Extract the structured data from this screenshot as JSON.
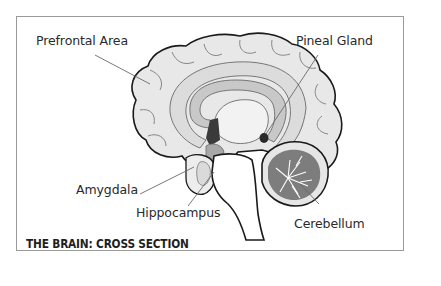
{
  "diagram": {
    "title": "THE BRAIN: CROSS SECTION",
    "labels": {
      "prefrontal": "Prefrontal Area",
      "pineal": "Pineal Gland",
      "amygdala": "Amygdala",
      "hippocampus": "Hippocampus",
      "cerebellum": "Cerebellum"
    },
    "colors": {
      "outline": "#1a1a1a",
      "cortex": "#e6e6e6",
      "corpus_callosum": "#d2d2d2",
      "ventricle": "#bdbdbd",
      "dark_structure": "#3a3a3a",
      "cerebellum": "#7a7a7a",
      "leader_line": "#6a6a6a",
      "frame": "#9a9a9a"
    }
  }
}
